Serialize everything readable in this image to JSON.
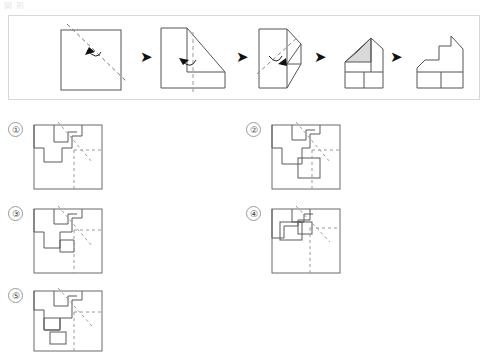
{
  "page": {
    "header_fragment": "図 形",
    "kind": "paper-folding-punch-puzzle"
  },
  "sequence": {
    "label": "folding-sequence",
    "arrow_glyph": "➤",
    "steps": [
      {
        "id": "step-1",
        "caption": "square-with-diagonal-fold-line",
        "fold": "diagonal",
        "has_curved_arrow": true
      },
      {
        "id": "step-2",
        "caption": "L-shape-with-vertical-fold-line",
        "fold": "vertical",
        "has_curved_arrow": true
      },
      {
        "id": "step-3",
        "caption": "folded-with-diagonal-fold-line",
        "fold": "diagonal",
        "has_curved_arrow": true
      },
      {
        "id": "step-4",
        "caption": "house-shape-with-shaded-cut-triangle",
        "fold": "none",
        "has_curved_arrow": false,
        "shaded": true
      },
      {
        "id": "step-5",
        "caption": "final-cut-shape",
        "fold": "none",
        "has_curved_arrow": false
      }
    ]
  },
  "options": [
    {
      "id": "option-1",
      "number": "①"
    },
    {
      "id": "option-2",
      "number": "②"
    },
    {
      "id": "option-3",
      "number": "③"
    },
    {
      "id": "option-4",
      "number": "④"
    },
    {
      "id": "option-5",
      "number": "⑤"
    }
  ],
  "colors": {
    "stroke": "#555555",
    "stroke_dark": "#333333",
    "dashed": "#8a8a8a",
    "shade_fill": "#d9d9d9",
    "panel_border": "#d8d8d8",
    "background": "#ffffff"
  }
}
